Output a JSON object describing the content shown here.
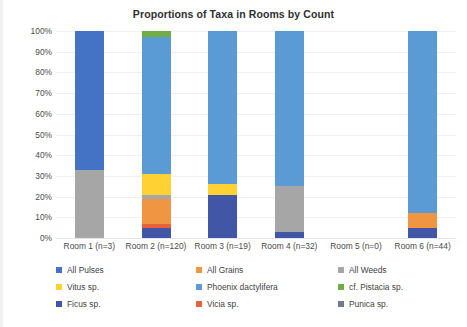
{
  "chart_data": {
    "type": "bar",
    "subtype": "stacked-100-percent",
    "title": "Proportions of Taxa in Rooms by Count",
    "xlabel": "",
    "ylabel": "",
    "ylim": [
      0,
      100
    ],
    "ytick_labels": [
      "100%",
      "90%",
      "80%",
      "70%",
      "60%",
      "50%",
      "40%",
      "30%",
      "20%",
      "10%",
      "0%"
    ],
    "ytick_values": [
      100,
      90,
      80,
      70,
      60,
      50,
      40,
      30,
      20,
      10,
      0
    ],
    "grid": true,
    "legend_position": "bottom",
    "categories": [
      "Room 1 (n=3)",
      "Room 2 (n=120)",
      "Room 3 (n=19)",
      "Room 4 (n=32)",
      "Room 5 (n=0)",
      "Room 6 (n=44)"
    ],
    "series": [
      {
        "name": "All Pulses",
        "color": "#4472C4",
        "values": [
          67,
          0,
          0,
          0,
          0,
          0
        ]
      },
      {
        "name": "All Grains",
        "color": "#F09542",
        "values": [
          0,
          12,
          0,
          0,
          0,
          7
        ]
      },
      {
        "name": "All Weeds",
        "color": "#A6A6A6",
        "values": [
          33,
          2,
          0,
          22,
          0,
          0
        ]
      },
      {
        "name": "Vitus sp.",
        "color": "#FFD133",
        "values": [
          0,
          10,
          5,
          0,
          0,
          0
        ]
      },
      {
        "name": "Phoenix dactylifera",
        "color": "#5B9BD5",
        "values": [
          0,
          66,
          74,
          75,
          0,
          88
        ]
      },
      {
        "name": "cf. Pistacia sp.",
        "color": "#70AD47",
        "values": [
          0,
          3,
          0,
          0,
          0,
          0
        ]
      },
      {
        "name": "Ficus sp.",
        "color": "#4156A6",
        "values": [
          0,
          5,
          21,
          3,
          0,
          5
        ]
      },
      {
        "name": "Vicia sp.",
        "color": "#E8633A",
        "values": [
          0,
          2,
          0,
          0,
          0,
          0
        ]
      },
      {
        "name": "Punica sp.",
        "color": "#707B8C",
        "values": [
          0,
          0,
          0,
          0,
          0,
          0
        ]
      }
    ],
    "stack_order": [
      "Ficus sp.",
      "Vicia sp.",
      "All Grains",
      "All Weeds",
      "Vitus sp.",
      "All Pulses",
      "Phoenix dactylifera",
      "cf. Pistacia sp.",
      "Punica sp."
    ]
  },
  "legend": {
    "entries": [
      {
        "label": "All Pulses",
        "color": "#4472C4"
      },
      {
        "label": "All Grains",
        "color": "#F09542"
      },
      {
        "label": "All Weeds",
        "color": "#A6A6A6"
      },
      {
        "label": "Vitus sp.",
        "color": "#FFD133"
      },
      {
        "label": "Phoenix dactylifera",
        "color": "#5B9BD5"
      },
      {
        "label": "cf. Pistacia sp.",
        "color": "#70AD47"
      },
      {
        "label": "Ficus sp.",
        "color": "#4156A6"
      },
      {
        "label": "Vicia sp.",
        "color": "#E8633A"
      },
      {
        "label": "Punica sp.",
        "color": "#707B8C"
      }
    ]
  }
}
